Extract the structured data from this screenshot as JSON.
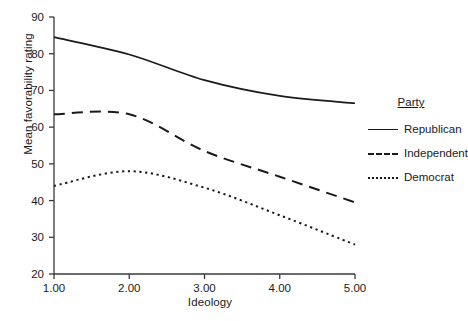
{
  "chart_data": {
    "type": "line",
    "title": "",
    "xlabel": "Ideology",
    "ylabel": "Mean favorability rating",
    "x": [
      1.0,
      2.0,
      3.0,
      4.0,
      5.0
    ],
    "xticklabels": [
      "1.00",
      "2.00",
      "3.00",
      "4.00",
      "5.00"
    ],
    "yticklabels": [
      "20",
      "30",
      "40",
      "50",
      "60",
      "70",
      "80",
      "90"
    ],
    "yticks": [
      20,
      30,
      40,
      50,
      60,
      70,
      80,
      90
    ],
    "xlim": [
      1.0,
      5.0
    ],
    "ylim": [
      20,
      90
    ],
    "grid": false,
    "legend_position": "right",
    "legend_title": "Party",
    "series": [
      {
        "name": "Republican",
        "style": "solid",
        "color": "#1a1a1a",
        "values": [
          84.5,
          79.8,
          72.8,
          68.5,
          66.5
        ]
      },
      {
        "name": "Independent",
        "style": "dashed",
        "color": "#1a1a1a",
        "values": [
          63.5,
          63.5,
          53.5,
          46.5,
          39.5
        ]
      },
      {
        "name": "Democrat",
        "style": "dotted",
        "color": "#1a1a1a",
        "values": [
          44.0,
          48.0,
          43.5,
          36.0,
          28.0
        ]
      }
    ]
  },
  "axes": {
    "x_title": "Ideology",
    "y_title": "Mean favorability rating"
  },
  "legend": {
    "title": "Party",
    "items": [
      {
        "label": "Republican"
      },
      {
        "label": "Independent"
      },
      {
        "label": "Democrat"
      }
    ]
  }
}
